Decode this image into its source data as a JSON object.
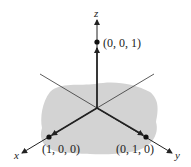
{
  "diagram": {
    "type": "3d-coordinate-axes",
    "axes": {
      "x": "x",
      "y": "y",
      "z": "z"
    },
    "points": [
      {
        "label": "(0, 0, 1)"
      },
      {
        "label": "(1, 0, 0)"
      },
      {
        "label": "(0, 1, 0)"
      }
    ],
    "colors": {
      "region": "#d3d3d3",
      "axis": "#222222"
    }
  }
}
